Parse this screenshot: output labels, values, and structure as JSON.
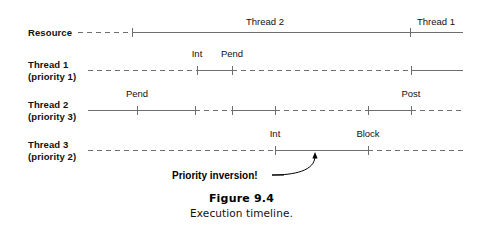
{
  "figure": {
    "caption_title": "Figure 9.4",
    "caption_subtitle": "Execution timeline."
  },
  "style": {
    "line_color": "#6e6e6e",
    "text_color": "#111111",
    "background": "#ffffff",
    "line_width": 1,
    "tick_height": 9,
    "dash_pattern": "5 4"
  },
  "axis": {
    "x_start": 88,
    "x_end": 463,
    "resource_x_start": 78
  },
  "annotation": {
    "label": "Priority inversion!",
    "label_x": 172,
    "label_y": 170,
    "arrow_from_x": 278,
    "arrow_from_y": 175,
    "arrow_to_x": 315,
    "arrow_to_y": 153,
    "target": "thread-3-running-segment"
  },
  "rows": [
    {
      "id": "resource",
      "name": "Resource",
      "label_line1": "Resource",
      "label_line2": "",
      "label_x": 28,
      "label_y": 27,
      "y": 32,
      "segments": [
        {
          "x1": 78,
          "x2": 132,
          "state": "idle",
          "style": "dashed"
        },
        {
          "x1": 132,
          "x2": 410,
          "state": "held",
          "style": "solid"
        },
        {
          "x1": 410,
          "x2": 463,
          "state": "held",
          "style": "solid"
        }
      ],
      "ticks": [
        {
          "x": 132,
          "label": "",
          "label_pos": ""
        },
        {
          "x": 410,
          "label": "",
          "label_pos": ""
        }
      ],
      "segment_labels": [
        {
          "text": "Thread 2",
          "x": 265,
          "y": 16,
          "align": "center"
        },
        {
          "text": "Thread 1",
          "x": 436,
          "y": 16,
          "align": "center"
        }
      ]
    },
    {
      "id": "thread-1",
      "name": "Thread 1",
      "label_line1": "Thread 1",
      "label_line2": "(priority 1)",
      "label_x": 28,
      "label_y": 59,
      "y": 70,
      "segments": [
        {
          "x1": 88,
          "x2": 197,
          "state": "blocked",
          "style": "dashed"
        },
        {
          "x1": 197,
          "x2": 232,
          "state": "running",
          "style": "solid"
        },
        {
          "x1": 232,
          "x2": 411,
          "state": "blocked",
          "style": "dashed"
        },
        {
          "x1": 411,
          "x2": 463,
          "state": "running",
          "style": "solid"
        }
      ],
      "ticks": [
        {
          "x": 197,
          "label": "Int",
          "label_pos": "above"
        },
        {
          "x": 232,
          "label": "Pend",
          "label_pos": "above"
        },
        {
          "x": 411,
          "label": "",
          "label_pos": ""
        }
      ],
      "segment_labels": []
    },
    {
      "id": "thread-2",
      "name": "Thread 2",
      "label_line1": "Thread 2",
      "label_line2": "(priority 3)",
      "label_x": 28,
      "label_y": 99,
      "y": 110,
      "segments": [
        {
          "x1": 88,
          "x2": 195,
          "state": "running",
          "style": "solid"
        },
        {
          "x1": 195,
          "x2": 232,
          "state": "ready",
          "style": "dashed"
        },
        {
          "x1": 232,
          "x2": 275,
          "state": "running",
          "style": "solid"
        },
        {
          "x1": 275,
          "x2": 368,
          "state": "ready",
          "style": "dashed"
        },
        {
          "x1": 368,
          "x2": 411,
          "state": "running",
          "style": "solid"
        },
        {
          "x1": 411,
          "x2": 463,
          "state": "ready",
          "style": "dashed"
        }
      ],
      "ticks": [
        {
          "x": 137,
          "label": "Pend",
          "label_pos": "above"
        },
        {
          "x": 195,
          "label": "",
          "label_pos": ""
        },
        {
          "x": 232,
          "label": "",
          "label_pos": ""
        },
        {
          "x": 275,
          "label": "",
          "label_pos": ""
        },
        {
          "x": 368,
          "label": "",
          "label_pos": ""
        },
        {
          "x": 411,
          "label": "Post",
          "label_pos": "above"
        }
      ],
      "segment_labels": []
    },
    {
      "id": "thread-3",
      "name": "Thread 3",
      "label_line1": "Thread 3",
      "label_line2": "(priority 2)",
      "label_x": 28,
      "label_y": 139,
      "y": 150,
      "segments": [
        {
          "x1": 88,
          "x2": 275,
          "state": "ready",
          "style": "dashed"
        },
        {
          "x1": 275,
          "x2": 368,
          "state": "running",
          "style": "solid"
        },
        {
          "x1": 368,
          "x2": 463,
          "state": "ready",
          "style": "dashed"
        }
      ],
      "ticks": [
        {
          "x": 275,
          "label": "Int",
          "label_pos": "above"
        },
        {
          "x": 368,
          "label": "Block",
          "label_pos": "above"
        }
      ],
      "segment_labels": []
    }
  ],
  "caption_layout": {
    "title_y": 192,
    "sub_y": 206
  }
}
